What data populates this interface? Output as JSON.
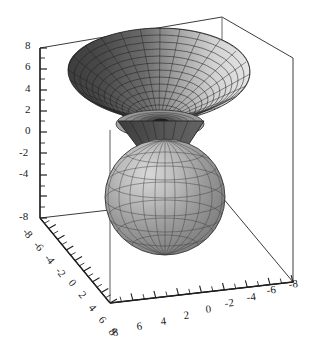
{
  "figure": {
    "type": "3d-surface-plot",
    "title": "",
    "background_color": "#ffffff",
    "rendering": "grayscale-shaded-mesh",
    "projection": "axonometric"
  },
  "chart_data": {
    "type": "surface3d",
    "title": "",
    "xlabel": "",
    "ylabel": "",
    "zlabel": "",
    "xlim": [
      -8,
      8
    ],
    "ylim": [
      -8,
      8
    ],
    "zlim": [
      -8,
      8
    ],
    "grid": true,
    "legend": null,
    "axes": {
      "z": {
        "name": "vertical-axis",
        "orientation": "vertical-left",
        "range": [
          -8,
          8
        ],
        "tick_labels": [
          "8",
          "6",
          "4",
          "2",
          "0",
          "-2",
          "-4",
          "-8"
        ],
        "tick_values": [
          8,
          6,
          4,
          2,
          0,
          -2,
          -4,
          -8
        ],
        "minor_ticks_per_major": 2
      },
      "y": {
        "name": "left-diagonal-axis",
        "orientation": "diagonal-down-right",
        "range": [
          -8,
          8
        ],
        "tick_labels": [
          "-8",
          "-6",
          "-4",
          "-2",
          "0",
          "2",
          "4",
          "6",
          "8"
        ],
        "tick_values": [
          -8,
          -6,
          -4,
          -2,
          0,
          2,
          4,
          6,
          8
        ],
        "label_rotation_deg": 55,
        "direction": "increasing toward viewer"
      },
      "x": {
        "name": "bottom-diagonal-axis",
        "orientation": "diagonal-up-right",
        "range": [
          8,
          -8
        ],
        "tick_labels": [
          "8",
          "6",
          "4",
          "2",
          "0",
          "-2",
          "-4",
          "-6",
          "-8"
        ],
        "tick_values": [
          8,
          6,
          4,
          2,
          0,
          -2,
          -4,
          -6,
          -8
        ],
        "label_rotation_deg": -14,
        "direction": "decreasing toward right"
      }
    },
    "surfaces": [
      {
        "name": "upper-funnel",
        "shape": "flared cone / funnel opening upward",
        "z_range": [
          2,
          8
        ],
        "rim_radius": 8,
        "apex_z": 2,
        "shading": "dark on left limb, light on right limb",
        "mesh": {
          "radial_lines": 24,
          "circumferential_lines": 14
        }
      },
      {
        "name": "inverted-cone",
        "shape": "cone apex pointing downward",
        "z_range": [
          -2,
          2
        ],
        "apex_z": -2,
        "shading": "dark gray",
        "mesh": {
          "radial_lines": 24,
          "circumferential_lines": 6
        }
      },
      {
        "name": "lower-sphere",
        "shape": "ellipsoid / sphere",
        "z_range": [
          -6,
          1
        ],
        "radius": 3.6,
        "center_z": -2.6,
        "shading": "medium gray, lighter on upper-left",
        "mesh": {
          "meridians": 24,
          "parallels": 10
        }
      },
      {
        "name": "inner-disc",
        "shape": "concentric ring disc at funnel throat",
        "z_range": [
          2,
          2.4
        ],
        "shading": "mid gray with dark center hole"
      }
    ],
    "colors": {
      "ink": "#1a1a1a",
      "axis": "#3c3c3c",
      "surface_dark": "#4a4a4a",
      "surface_mid": "#8e8e8e",
      "surface_light": "#dcdcdc",
      "mesh_line": "#2b2b2b",
      "background": "#ffffff"
    }
  },
  "z_axis_labels": [
    {
      "text": "8",
      "x": 25,
      "y": 49
    },
    {
      "text": "6",
      "x": 25,
      "y": 70
    },
    {
      "text": "4",
      "x": 25,
      "y": 92
    },
    {
      "text": "2",
      "x": 25,
      "y": 113
    },
    {
      "text": "0",
      "x": 25,
      "y": 134
    },
    {
      "text": "-2",
      "x": 19,
      "y": 156
    },
    {
      "text": "-4",
      "x": 19,
      "y": 177
    },
    {
      "text": "-8",
      "x": 19,
      "y": 220
    }
  ],
  "y_axis_labels": [
    {
      "text": "-8",
      "x": 22,
      "y": 232
    },
    {
      "text": "-6",
      "x": 33,
      "y": 245
    },
    {
      "text": "-4",
      "x": 44,
      "y": 258
    },
    {
      "text": "-2",
      "x": 55,
      "y": 271
    },
    {
      "text": "0",
      "x": 68,
      "y": 283
    },
    {
      "text": "2",
      "x": 78,
      "y": 295
    },
    {
      "text": "4",
      "x": 88,
      "y": 308
    },
    {
      "text": "6",
      "x": 98,
      "y": 320
    },
    {
      "text": "8",
      "x": 108,
      "y": 332
    }
  ],
  "x_axis_labels": [
    {
      "text": "8",
      "x": 113,
      "y": 336
    },
    {
      "text": "6",
      "x": 137,
      "y": 330
    },
    {
      "text": "4",
      "x": 161,
      "y": 325
    },
    {
      "text": "2",
      "x": 184,
      "y": 319
    },
    {
      "text": "0",
      "x": 206,
      "y": 313
    },
    {
      "text": "-2",
      "x": 225,
      "y": 307
    },
    {
      "text": "-4",
      "x": 247,
      "y": 301
    },
    {
      "text": "-6",
      "x": 267,
      "y": 294
    },
    {
      "text": "-8",
      "x": 289,
      "y": 288
    }
  ]
}
